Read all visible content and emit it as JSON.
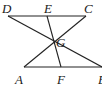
{
  "diagram": {
    "points": {
      "D": {
        "label": "D",
        "x": 8,
        "y": 16
      },
      "E": {
        "label": "E",
        "x": 47,
        "y": 16
      },
      "C": {
        "label": "C",
        "x": 85,
        "y": 16
      },
      "G": {
        "label": "G",
        "x": 54,
        "y": 43
      },
      "A": {
        "label": "A",
        "x": 24,
        "y": 67
      },
      "F": {
        "label": "F",
        "x": 61,
        "y": 67
      },
      "B": {
        "label": "B",
        "x": 102,
        "y": 67
      }
    },
    "segments": [
      [
        "D",
        "C"
      ],
      [
        "A",
        "B"
      ],
      [
        "D",
        "B"
      ],
      [
        "A",
        "C"
      ],
      [
        "E",
        "F"
      ]
    ],
    "labels": {
      "D": "D",
      "E": "E",
      "C": "C",
      "G": "G",
      "A": "A",
      "F": "F",
      "B": "B"
    }
  }
}
